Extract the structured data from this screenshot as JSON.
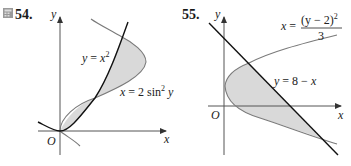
{
  "problems": [
    {
      "number": "54.",
      "has_calculator_icon": true,
      "axis_labels": {
        "x": "x",
        "y": "y",
        "origin": "O"
      },
      "curves": [
        {
          "name": "parabola",
          "label": "y = x²",
          "equation_lhs": "y = ",
          "equation_var": "x",
          "equation_sup": "2"
        },
        {
          "name": "sine-curve",
          "label": "x = 2 sin² y",
          "equation_lhs": "x = 2 sin",
          "equation_sup": "2",
          "equation_var": "y"
        }
      ],
      "shaded_region": "area enclosed between y = x² and x = 2 sin² y"
    },
    {
      "number": "55.",
      "axis_labels": {
        "x": "x",
        "y": "y",
        "origin": "O"
      },
      "curves": [
        {
          "name": "parabola",
          "label": "x = (y − 2)² / 3",
          "equation_lhs": "x = ",
          "numerator": "(y − 2)",
          "numerator_sup": "2",
          "denominator": "3"
        },
        {
          "name": "line",
          "label": "y = 8 − x"
        }
      ],
      "shaded_region": "area enclosed between x = (y − 2)²/3 and y = 8 − x"
    }
  ],
  "colors": {
    "axis": "#555555",
    "curve_dark": "#111111",
    "curve_gray": "#7a7a7a",
    "shade": "#d9d9d9"
  }
}
